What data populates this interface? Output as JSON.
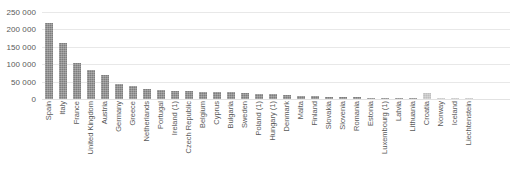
{
  "chart_data": {
    "type": "bar",
    "title": "",
    "xlabel": "",
    "ylabel": "",
    "ylim": [
      0,
      250000
    ],
    "yticks": [
      "0",
      "50 000",
      "100 000",
      "150 000",
      "200 000",
      "250 000"
    ],
    "ytick_values": [
      0,
      50000,
      100000,
      150000,
      200000,
      250000
    ],
    "grid": true,
    "legend": "none",
    "categories": [
      "Spain",
      "Italy",
      "France",
      "United Kingdom",
      "Austria",
      "Germany",
      "Greece",
      "Netherlands",
      "Portugal",
      "Ireland (1)",
      "Czech Republic",
      "Belgium",
      "Cyprus",
      "Bulgaria",
      "Sweden",
      "Poland (1)",
      "Hungary (1)",
      "Denmark",
      "Malta",
      "Finland",
      "Slovakia",
      "Slovenia",
      "Romania",
      "Estonia",
      "Luxembourg (1)",
      "Latvia",
      "Lithuania",
      "Croatia",
      "Norway",
      "Iceland",
      "Liechtenstein"
    ],
    "values": [
      218000,
      160000,
      104000,
      82000,
      69000,
      42000,
      38000,
      30000,
      25000,
      23000,
      22000,
      21000,
      20000,
      19000,
      18000,
      15000,
      13000,
      12000,
      9000,
      8000,
      7000,
      6000,
      5000,
      4000,
      3500,
      3000,
      2500,
      17000,
      2000,
      800,
      300
    ],
    "bar_colors": [
      "dark",
      "dark",
      "dark",
      "dark",
      "dark",
      "dark",
      "dark",
      "dark",
      "dark",
      "dark",
      "dark",
      "dark",
      "dark",
      "dark",
      "dark",
      "dark",
      "dark",
      "dark",
      "dark",
      "dark",
      "dark",
      "dark",
      "dark",
      "dark",
      "dark",
      "dark",
      "dark",
      "light",
      "light",
      "light",
      "light"
    ],
    "colors": {
      "bar_dark": "#7e7e7e",
      "bar_light": "#bfbfbf",
      "gridline": "#e8e8e8",
      "text": "#595959",
      "background": "#ffffff"
    }
  }
}
